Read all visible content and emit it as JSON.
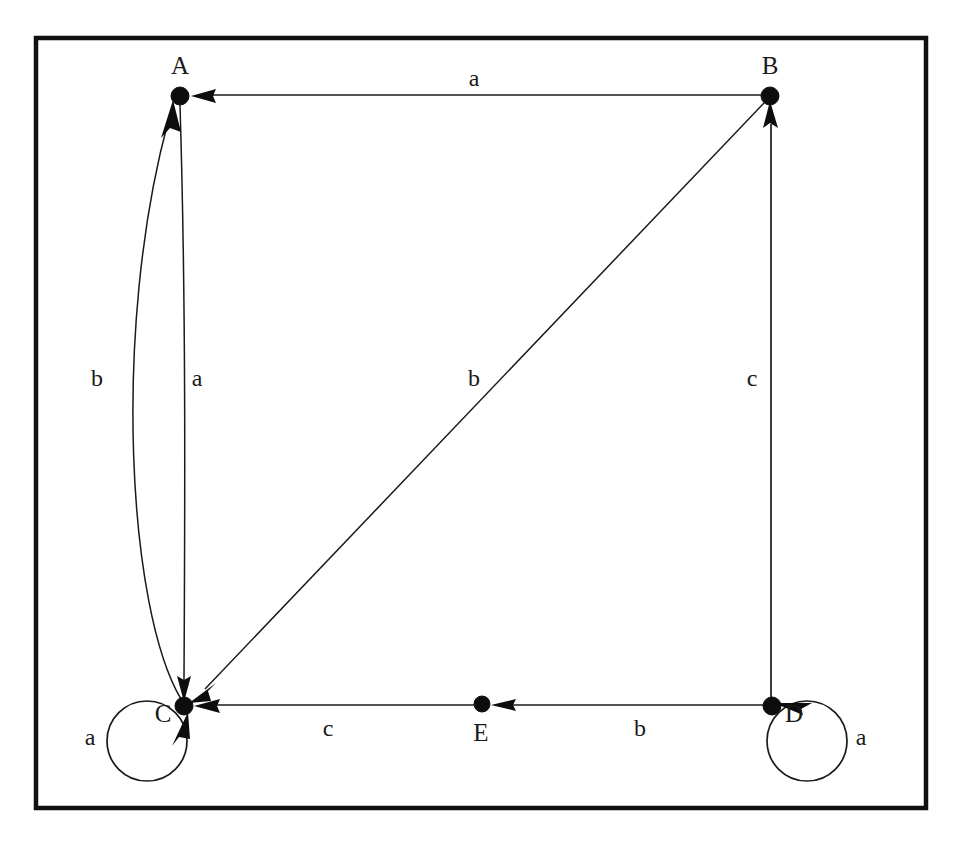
{
  "figure": {
    "kind": "labeled-directed-graph",
    "background_color": "#ffffff",
    "ink_color": "#1a1a1a",
    "frame": {
      "x": 34,
      "y": 36,
      "width": 894,
      "height": 774,
      "stroke_color": "#111111"
    }
  },
  "nodes": [
    {
      "id": "A",
      "label": "A",
      "x": 180,
      "y": 96,
      "label_x": 180,
      "label_y": 74,
      "radius": 9,
      "self_loop": false
    },
    {
      "id": "B",
      "label": "B",
      "x": 770,
      "y": 96,
      "label_x": 770,
      "label_y": 74,
      "radius": 9,
      "self_loop": false
    },
    {
      "id": "C",
      "label": "C",
      "x": 184,
      "y": 706,
      "label_x": 163,
      "label_y": 722,
      "radius": 9,
      "self_loop": true
    },
    {
      "id": "D",
      "label": "D",
      "x": 772,
      "y": 706,
      "label_x": 794,
      "label_y": 722,
      "radius": 9,
      "self_loop": true
    },
    {
      "id": "E",
      "label": "E",
      "x": 482,
      "y": 704,
      "label_x": 481,
      "label_y": 741,
      "radius": 8,
      "self_loop": false
    }
  ],
  "edges": [
    {
      "id": "B-A",
      "from": "B",
      "to": "A",
      "label": "a",
      "label_x": 474,
      "label_y": 86,
      "shape": "straight-horizontal",
      "arrow_at": "A"
    },
    {
      "id": "C-A",
      "from": "C",
      "to": "A",
      "label": "b",
      "label_x": 97,
      "label_y": 386,
      "shape": "curve-left-bulge",
      "arrow_at": "A"
    },
    {
      "id": "A-C",
      "from": "A",
      "to": "C",
      "label": "a",
      "label_x": 197,
      "label_y": 386,
      "shape": "near-straight",
      "arrow_at": "C"
    },
    {
      "id": "B-C",
      "from": "B",
      "to": "C",
      "label": "b",
      "label_x": 474,
      "label_y": 386,
      "shape": "diagonal",
      "arrow_at": "C"
    },
    {
      "id": "D-B",
      "from": "D",
      "to": "B",
      "label": "c",
      "label_x": 752,
      "label_y": 386,
      "shape": "straight-vertical",
      "arrow_at": "B"
    },
    {
      "id": "E-C",
      "from": "E",
      "to": "C",
      "label": "c",
      "label_x": 328,
      "label_y": 736,
      "shape": "straight-horizontal",
      "arrow_at": "C"
    },
    {
      "id": "D-E",
      "from": "D",
      "to": "E",
      "label": "b",
      "label_x": 640,
      "label_y": 736,
      "shape": "straight-horizontal",
      "arrow_at": "E"
    },
    {
      "id": "C-C",
      "from": "C",
      "to": "C",
      "label": "a",
      "label_x": 90,
      "label_y": 745,
      "shape": "self-loop-left",
      "arrow_at": "C"
    },
    {
      "id": "D-D",
      "from": "D",
      "to": "D",
      "label": "a",
      "label_x": 861,
      "label_y": 745,
      "shape": "self-loop-right",
      "arrow_at": "D"
    }
  ]
}
